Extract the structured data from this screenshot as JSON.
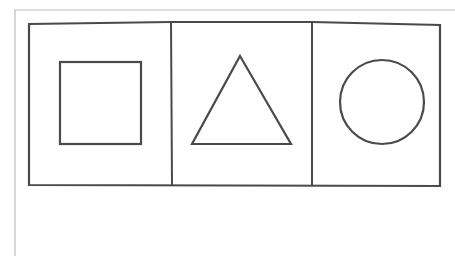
{
  "diagram": {
    "stroke_color": "#4a4a4a",
    "page_border_color": "#b8b8b8",
    "panels": [
      {
        "shape": "square",
        "label": ""
      },
      {
        "shape": "triangle",
        "label": ""
      },
      {
        "shape": "circle",
        "label": ""
      }
    ]
  }
}
